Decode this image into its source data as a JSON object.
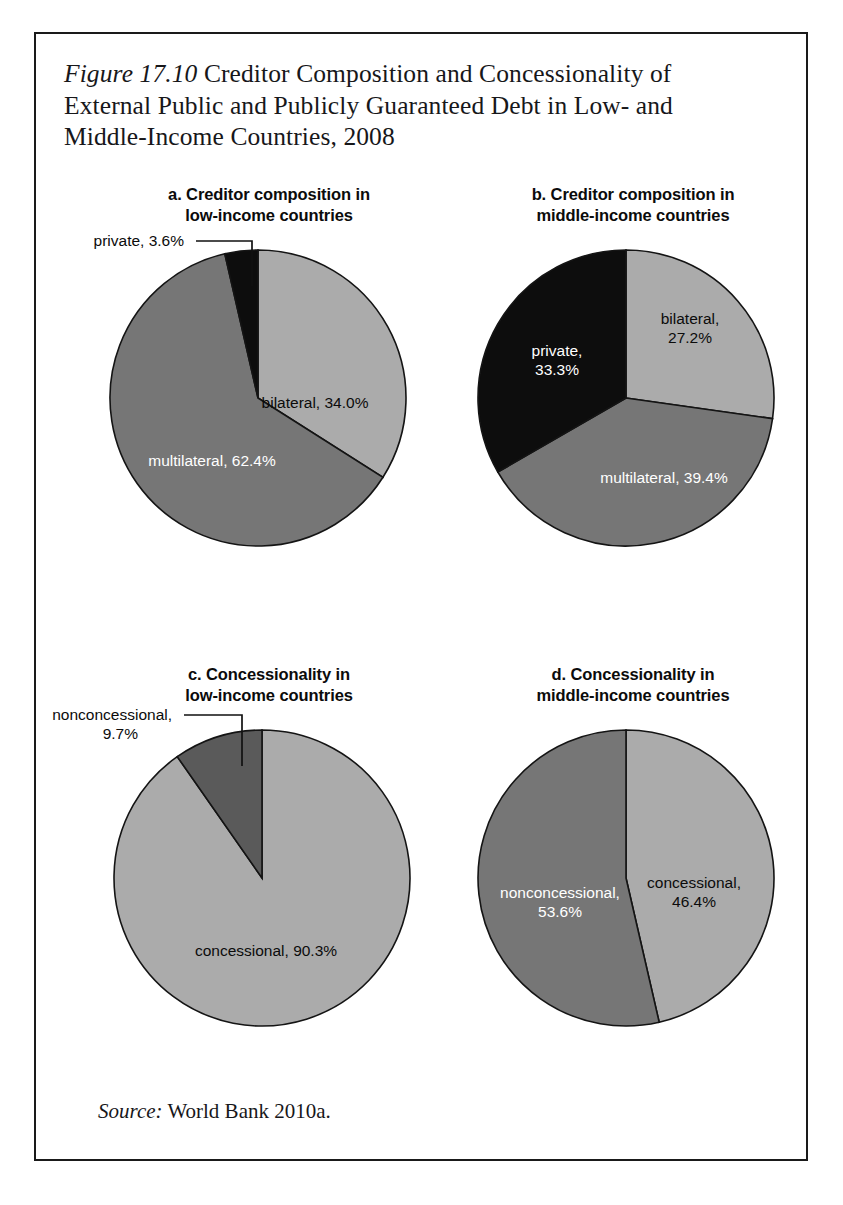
{
  "figure": {
    "label": "Figure 17.10",
    "title_rest": " Creditor Composition and Concessionality of External Public and Publicly Guaranteed Debt in Low- and Middle-Income Countries, 2008",
    "full_title": "Figure 17.10 Creditor Composition and Concessionality of External Public and Publicly Guaranteed Debt in Low- and Middle-Income Countries, 2008",
    "source_label": "Source:",
    "source_text": " World Bank 2010a."
  },
  "colors": {
    "black_slice": "#0d0d0d",
    "dark_gray_slice": "#5a5a5a",
    "medium_gray_slice": "#767676",
    "light_gray_slice": "#ababab",
    "outline": "#141414",
    "text_dark": "#0b0b0b",
    "text_light": "#ffffff"
  },
  "chart_data": [
    {
      "id": "panel-a",
      "type": "pie",
      "title": "a. Creditor composition in low-income countries",
      "title_lines": [
        "a. Creditor composition in",
        "low-income countries"
      ],
      "categories": [
        "bilateral",
        "multilateral",
        "private"
      ],
      "values": [
        34.0,
        62.4,
        3.6
      ],
      "value_labels": [
        "34.0%",
        "62.4%",
        "3.6%"
      ],
      "slices": [
        {
          "name": "bilateral",
          "value": 34.0,
          "label": "bilateral, 34.0%",
          "color": "#ababab",
          "text_color": "dark",
          "label_x": 239,
          "label_y": 180,
          "anchor": "middle",
          "callout": false
        },
        {
          "name": "multilateral",
          "value": 62.4,
          "label": "multilateral, 62.4%",
          "color": "#767676",
          "text_color": "light",
          "label_x": 136,
          "label_y": 238,
          "anchor": "middle",
          "callout": false
        },
        {
          "name": "private",
          "value": 3.6,
          "label": "private, 3.6%",
          "color": "#0d0d0d",
          "text_color": "dark",
          "label_x": 108,
          "label_y": 18,
          "anchor": "end",
          "callout": true,
          "leader": "M 120 13 L 176 13 L 176 58"
        }
      ],
      "legend_position": "inside-slices",
      "start_angle_deg": 0,
      "direction": "clockwise"
    },
    {
      "id": "panel-b",
      "type": "pie",
      "title": "b. Creditor composition in middle-income countries",
      "title_lines": [
        "b. Creditor composition in",
        "middle-income countries"
      ],
      "categories": [
        "bilateral",
        "multilateral",
        "private"
      ],
      "values": [
        27.2,
        39.4,
        33.3
      ],
      "value_labels": [
        "27.2%",
        "39.4%",
        "33.3%"
      ],
      "slices": [
        {
          "name": "bilateral",
          "value": 27.2,
          "label": "bilateral,",
          "label2": "27.2%",
          "color": "#ababab",
          "text_color": "dark",
          "label_x": 250,
          "label_y": 96,
          "anchor": "middle",
          "callout": false
        },
        {
          "name": "multilateral",
          "value": 39.4,
          "label": "multilateral, 39.4%",
          "color": "#767676",
          "text_color": "light",
          "label_x": 224,
          "label_y": 255,
          "anchor": "middle",
          "callout": false
        },
        {
          "name": "private",
          "value": 33.3,
          "label": "private,",
          "label2": "33.3%",
          "color": "#0d0d0d",
          "text_color": "light",
          "label_x": 117,
          "label_y": 128,
          "anchor": "middle",
          "callout": false
        }
      ],
      "legend_position": "inside-slices",
      "start_angle_deg": 0,
      "direction": "clockwise"
    },
    {
      "id": "panel-c",
      "type": "pie",
      "title": "c. Concessionality in low-income countries",
      "title_lines": [
        "c. Concessionality in",
        "low-income countries"
      ],
      "categories": [
        "concessional",
        "nonconcessional"
      ],
      "values": [
        90.3,
        9.7
      ],
      "value_labels": [
        "90.3%",
        "9.7%"
      ],
      "slices": [
        {
          "name": "concessional",
          "value": 90.3,
          "label": "concessional, 90.3%",
          "color": "#ababab",
          "text_color": "dark",
          "label_x": 190,
          "label_y": 248,
          "anchor": "middle",
          "callout": false
        },
        {
          "name": "nonconcessional",
          "value": 9.7,
          "label": "nonconcessional,",
          "label2": "9.7%",
          "color": "#5a5a5a",
          "text_color": "dark",
          "label_x": 96,
          "label_y": 12,
          "anchor": "end",
          "callout": true,
          "leader": "M 108 7 L 166 7 L 166 58"
        }
      ],
      "legend_position": "inside-and-callout",
      "start_angle_deg": 0,
      "direction": "clockwise"
    },
    {
      "id": "panel-d",
      "type": "pie",
      "title": "d. Concessionality in middle-income countries",
      "title_lines": [
        "d. Concessionality in",
        "middle-income countries"
      ],
      "categories": [
        "concessional",
        "nonconcessional"
      ],
      "values": [
        46.4,
        53.6
      ],
      "value_labels": [
        "46.4%",
        "53.6%"
      ],
      "slices": [
        {
          "name": "concessional",
          "value": 46.4,
          "label": "concessional,",
          "label2": "46.4%",
          "color": "#ababab",
          "text_color": "dark",
          "label_x": 254,
          "label_y": 180,
          "anchor": "middle",
          "callout": false
        },
        {
          "name": "nonconcessional",
          "value": 53.6,
          "label": "nonconcessional,",
          "label2": "53.6%",
          "color": "#767676",
          "text_color": "light",
          "label_x": 120,
          "label_y": 190,
          "anchor": "middle",
          "callout": false
        }
      ],
      "legend_position": "inside-slices",
      "start_angle_deg": 0,
      "direction": "clockwise"
    }
  ],
  "panel_layout": [
    {
      "id": "panel-a",
      "left": 40,
      "top": 150,
      "radius": 148,
      "cx": 182,
      "cy": 170
    },
    {
      "id": "panel-b",
      "left": 404,
      "top": 150,
      "radius": 148,
      "cx": 186,
      "cy": 170
    },
    {
      "id": "panel-c",
      "left": 40,
      "top": 630,
      "radius": 148,
      "cx": 186,
      "cy": 170
    },
    {
      "id": "panel-d",
      "left": 404,
      "top": 630,
      "radius": 148,
      "cx": 186,
      "cy": 170
    }
  ]
}
